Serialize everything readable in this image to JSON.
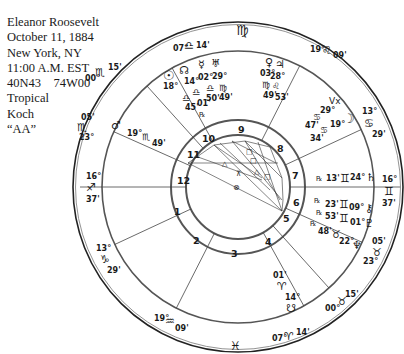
{
  "birth_info": {
    "name": "Eleanor Roosevelt",
    "date": "October 11, 1884",
    "place": "New York, NY",
    "time": "11:00 A.M. EST",
    "coordinates": "40N43    74W00",
    "zodiac": "Tropical",
    "house_system": "Koch",
    "rating": "“AA”"
  },
  "signs": {
    "top_sign": "♍",
    "bottom_sign": "♓"
  },
  "house_cusps": [
    {
      "house": "1",
      "deg": "16°",
      "sign": "♐",
      "min": "37'"
    },
    {
      "house": "2",
      "deg": "13°",
      "sign": "♑",
      "min": "29'"
    },
    {
      "house": "3",
      "deg": "19°",
      "sign": "♒",
      "min": "09'"
    },
    {
      "house": "4",
      "deg": "07°",
      "sign": "♈",
      "min": "14'"
    },
    {
      "house": "5",
      "deg": "00°",
      "sign": "♉",
      "min": "15'"
    },
    {
      "house": "6",
      "deg": "23°",
      "sign": "♉",
      "min": "05'"
    },
    {
      "house": "7",
      "deg": "16°",
      "sign": "♊",
      "min": "37'"
    },
    {
      "house": "8",
      "deg": "13°",
      "sign": "♋",
      "min": "29'"
    },
    {
      "house": "9",
      "deg": "19°",
      "sign": "♌",
      "min": "09'"
    },
    {
      "house": "10",
      "deg": "07°",
      "sign": "♎",
      "min": "14'"
    },
    {
      "house": "11",
      "deg": "00°",
      "sign": "♏",
      "min": "15'"
    },
    {
      "house": "12",
      "deg": "23°",
      "sign": "♏",
      "min": "05'"
    }
  ],
  "house_numbers": [
    "1",
    "2",
    "3",
    "4",
    "5",
    "6",
    "7",
    "8",
    "9",
    "10",
    "11",
    "12"
  ],
  "planets": [
    {
      "name": "Sun",
      "glyph": "☉",
      "deg": "18°",
      "sign": "♎",
      "min": "45'",
      "retro": ""
    },
    {
      "name": "North Node",
      "glyph": "☊",
      "deg": "14°",
      "sign": "♎",
      "min": "01'",
      "retro": "℞"
    },
    {
      "name": "Mercury",
      "glyph": "☿",
      "deg": "02°",
      "sign": "♎",
      "min": "50'",
      "retro": ""
    },
    {
      "name": "Uranus",
      "glyph": "♅",
      "deg": "29°",
      "sign": "♍",
      "min": "49'",
      "retro": ""
    },
    {
      "name": "Venus",
      "glyph": "♀",
      "deg": "03°",
      "sign": "♍",
      "min": "49'",
      "retro": ""
    },
    {
      "name": "Jupiter",
      "glyph": "♃",
      "deg": "28°",
      "sign": "♌",
      "min": "53'",
      "retro": ""
    },
    {
      "name": "Vertex",
      "glyph": "Vx",
      "deg": "29°",
      "sign": "♋",
      "min": "47'",
      "retro": ""
    },
    {
      "name": "Moon",
      "glyph": "☽",
      "deg": "19°",
      "sign": "♋",
      "min": "34'",
      "retro": ""
    },
    {
      "name": "Saturn",
      "glyph": "♄",
      "deg": "24°",
      "sign": "♊",
      "min": "13'",
      "retro": "℞"
    },
    {
      "name": "Chiron",
      "glyph": "⚷",
      "deg": "09°",
      "sign": "♊",
      "min": "23'",
      "retro": "℞"
    },
    {
      "name": "Pluto",
      "glyph": "♇",
      "deg": "01°",
      "sign": "♊",
      "min": "53'",
      "retro": "℞"
    },
    {
      "name": "Neptune",
      "glyph": "♆",
      "deg": "22°",
      "sign": "♉",
      "min": "48'",
      "retro": "℞"
    },
    {
      "name": "Mars",
      "glyph": "♂",
      "deg": "19°",
      "sign": "♏",
      "min": "49'",
      "retro": ""
    },
    {
      "name": "Part of Fortune",
      "glyph": "⊗",
      "deg": "01'",
      "sign": "♈",
      "min": "",
      "retro": ""
    },
    {
      "name": "South Node",
      "glyph": "☋",
      "deg": "14°",
      "sign": "",
      "min": "",
      "retro": ""
    }
  ]
}
